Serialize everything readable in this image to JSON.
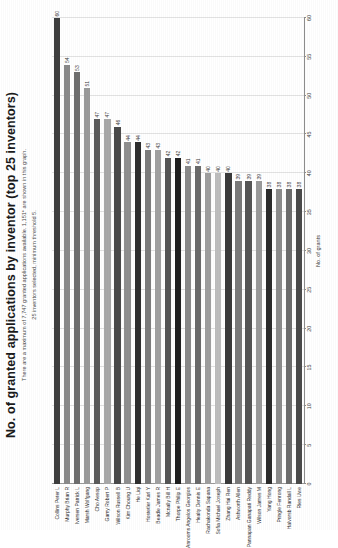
{
  "header": {
    "title": "No. of granted applications by inventor (top 25 inventors)",
    "subtitle_line1": "There are a maximum of 7,747 granted applications available. 1,151* are shown in this graph.",
    "subtitle_line2": "25 inventors selected, minimum threshold 5."
  },
  "chart_data": {
    "type": "bar",
    "orientation": "horizontal",
    "title": "No. of granted applications by inventor (top 25 inventors)",
    "subtitle": "There are a maximum of 7,747 granted applications available. 1,151* are shown in this graph. 25 inventors selected, minimum threshold 5.",
    "xlabel": "No. of grants",
    "ylabel": "",
    "xlim": [
      0,
      60
    ],
    "xticks": [
      0,
      5,
      10,
      15,
      20,
      25,
      30,
      35,
      40,
      45,
      50,
      55,
      60
    ],
    "grid": true,
    "legend": false,
    "categories": [
      "Collins Peter L",
      "Murphy Brian R",
      "Iversen Patrick L",
      "Marsh Wolfgang",
      "Cho Aesop",
      "Gamy Robert P",
      "Wilson Russell B",
      "Kim Choung U",
      "He Liqi",
      "Hostetler Karl Y",
      "Beadle James R",
      "Mcnally Bill H",
      "Thorpe Philip E",
      "Anrooms Angelos Georgios",
      "Healty Dennis E",
      "Rachakonda Sapana",
      "Sofia Michael Joseph",
      "Zhang Hai Ren",
      "Ashworth Allen",
      "Pannapan Ganapati Reddy",
      "Wilson James M",
      "Yang Hong",
      "Pringle Fenrong",
      "Halvorsb Randall L",
      "Ries Uwe"
    ],
    "values": [
      60,
      54,
      53,
      51,
      47,
      47,
      46,
      44,
      44,
      43,
      43,
      42,
      42,
      41,
      41,
      40,
      40,
      40,
      39,
      39,
      39,
      38,
      38,
      38,
      38
    ],
    "bar_labels": [
      "60",
      "54",
      "53",
      "51",
      "47",
      "47",
      "46",
      "44",
      "44",
      "43",
      "43",
      "42",
      "42",
      "41",
      "41",
      "40",
      "40",
      "40",
      "39",
      "39",
      "39",
      "38",
      "38",
      "38",
      "38"
    ],
    "bar_colors": [
      "#3f3f3f",
      "#8a8a8a",
      "#6e6e6e",
      "#9a9a9a",
      "#5c5c5c",
      "#a8a8a8",
      "#4a4a4a",
      "#8f8f8f",
      "#2e2e2e",
      "#7c7c7c",
      "#a0a0a0",
      "#555555",
      "#1f1f1f",
      "#8a8a8a",
      "#6a6a6a",
      "#9e9e9e",
      "#bdbdbd",
      "#3a3a3a",
      "#7a7a7a",
      "#555555",
      "#9a9a9a",
      "#2b2b2b",
      "#8c8c8c",
      "#6d6d6d",
      "#4a4a4a"
    ]
  }
}
